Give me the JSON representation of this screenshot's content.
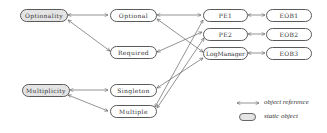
{
  "diagram": {
    "nodes": {
      "optionality": {
        "label": "Optionality",
        "static": true
      },
      "multiplicity": {
        "label": "Multiplicity",
        "static": true
      },
      "optional": {
        "label": "Optional"
      },
      "required": {
        "label": "Required"
      },
      "singleton": {
        "label": "Singleton"
      },
      "multiple": {
        "label": "Multiple"
      },
      "pe1": {
        "label": "PE1"
      },
      "pe2": {
        "label": "PE2"
      },
      "logmanager": {
        "label": "LogManager"
      },
      "eob1": {
        "label": "EOB1"
      },
      "eob2": {
        "label": "EOB2"
      },
      "eob3": {
        "label": "EOB3"
      }
    },
    "edges": [
      [
        "optionality",
        "optional"
      ],
      [
        "optionality",
        "required"
      ],
      [
        "multiplicity",
        "singleton"
      ],
      [
        "multiplicity",
        "multiple"
      ],
      [
        "optional",
        "pe1"
      ],
      [
        "optional",
        "logmanager"
      ],
      [
        "required",
        "pe2"
      ],
      [
        "singleton",
        "logmanager"
      ],
      [
        "multiple",
        "pe1"
      ],
      [
        "multiple",
        "pe2"
      ],
      [
        "pe1",
        "eob1"
      ],
      [
        "pe2",
        "eob2"
      ],
      [
        "logmanager",
        "eob3"
      ]
    ],
    "colors": {
      "static_fill": "#e4e4e4",
      "line": "#5a5a5a"
    }
  },
  "legend": {
    "reference_label": "object reference",
    "static_label": "static object"
  }
}
